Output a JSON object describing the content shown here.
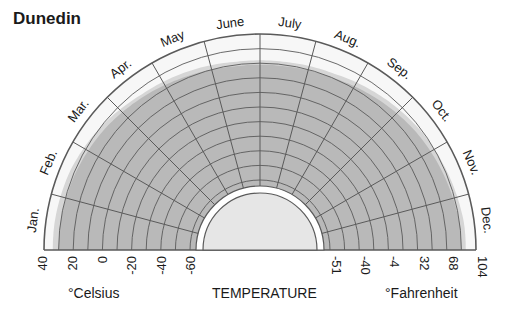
{
  "title": "Dunedin",
  "chart_data": {
    "type": "radial-area",
    "title": "Dunedin",
    "xlabel": "TEMPERATURE",
    "categories": [
      "Jan.",
      "Feb.",
      "Mar.",
      "Apr.",
      "May",
      "June",
      "July",
      "Aug.",
      "Sep.",
      "Oct.",
      "Nov.",
      "Dec."
    ],
    "celsius_axis": {
      "label": "°Celsius",
      "ticks": [
        "40",
        "20",
        "0",
        "-20",
        "-40",
        "-60"
      ]
    },
    "fahrenheit_axis": {
      "label": "°Fahrenheit",
      "ticks": [
        "-51",
        "-40",
        "-4",
        "32",
        "68",
        "104"
      ]
    },
    "series": [
      {
        "name": "Record high (°C)",
        "values": [
          34,
          33,
          30,
          26,
          24,
          22,
          22,
          23,
          26,
          29,
          31,
          33
        ]
      },
      {
        "name": "Average high (°C)",
        "values": [
          30,
          29,
          27,
          24,
          21,
          19,
          19,
          20,
          23,
          26,
          28,
          30
        ]
      },
      {
        "name": "Low bound (°C)",
        "values": [
          -60,
          -60,
          -60,
          -60,
          -60,
          -60,
          -60,
          -60,
          -60,
          -60,
          -60,
          -60
        ]
      }
    ],
    "ylim": [
      -60,
      40
    ],
    "grid": true
  },
  "colors": {
    "band_light": "#d6d6d6",
    "band_dark": "#b9b9b9",
    "grid": "#5a5a5a",
    "hub": "#e6e6e6",
    "background_ring": "#f7f7f7"
  }
}
